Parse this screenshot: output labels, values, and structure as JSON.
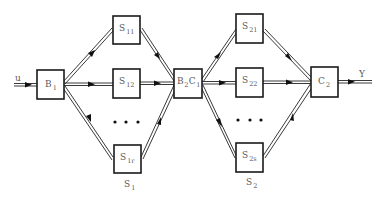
{
  "diagram": {
    "input_label": "u",
    "output_label": "Y",
    "blocks": {
      "b1": {
        "main": "B",
        "sub": "1"
      },
      "s11": {
        "main": "S",
        "sub": "11"
      },
      "s12": {
        "main": "S",
        "sub": "12"
      },
      "s1r": {
        "main": "S",
        "sub": "1r"
      },
      "b2c1": {
        "main1": "B",
        "sub1": "2",
        "main2": "C",
        "sub2": "1"
      },
      "s21": {
        "main": "S",
        "sub": "21"
      },
      "s22": {
        "main": "S",
        "sub": "22"
      },
      "s2s": {
        "main": "S",
        "sub": "2s"
      },
      "c2": {
        "main": "C",
        "sub": "2"
      }
    },
    "group_labels": {
      "stage1": {
        "main": "S",
        "sub": "1"
      },
      "stage2": {
        "main": "S",
        "sub": "2"
      }
    },
    "ellipsis": "• • •",
    "colors": {
      "line": "#3a3a3a",
      "box": "#1a1a1a",
      "text": "#5a5a5a"
    }
  }
}
